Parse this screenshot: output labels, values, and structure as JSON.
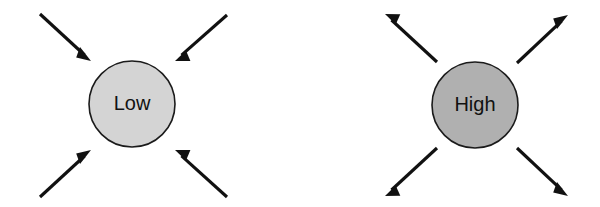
{
  "canvas": {
    "width": 600,
    "height": 207,
    "background": "#ffffff"
  },
  "diagram": {
    "type": "concept-diagram",
    "panels": [
      {
        "id": "panel-low",
        "node": {
          "label": "Low",
          "shape": "circle",
          "center_x": 132,
          "center_y": 104,
          "radius": 43,
          "fill": "#d4d4d4",
          "stroke": "#1b1b1b",
          "text_color": "#111111",
          "font_size": 20
        },
        "arrow_direction": "inward",
        "arrow_count": 4,
        "arrows": [
          {
            "id": "low-arrow-top-left",
            "from_x": 40,
            "from_y": 14,
            "to_x": 91,
            "to_y": 61
          },
          {
            "id": "low-arrow-top-right",
            "from_x": 227,
            "from_y": 15,
            "to_x": 175,
            "to_y": 61
          },
          {
            "id": "low-arrow-bottom-left",
            "from_x": 40,
            "from_y": 197,
            "to_x": 91,
            "to_y": 150
          },
          {
            "id": "low-arrow-bottom-right",
            "from_x": 227,
            "from_y": 197,
            "to_x": 175,
            "to_y": 150
          }
        ]
      },
      {
        "id": "panel-high",
        "node": {
          "label": "High",
          "shape": "circle",
          "center_x": 475,
          "center_y": 105,
          "radius": 43,
          "fill": "#b0b0b0",
          "stroke": "#1b1b1b",
          "text_color": "#111111",
          "font_size": 20
        },
        "arrow_direction": "outward",
        "arrow_count": 4,
        "arrows": [
          {
            "id": "high-arrow-top-left",
            "from_x": 437,
            "from_y": 62,
            "to_x": 385,
            "to_y": 14
          },
          {
            "id": "high-arrow-top-right",
            "from_x": 517,
            "from_y": 63,
            "to_x": 568,
            "to_y": 15
          },
          {
            "id": "high-arrow-bottom-left",
            "from_x": 437,
            "from_y": 148,
            "to_x": 385,
            "to_y": 196
          },
          {
            "id": "high-arrow-bottom-right",
            "from_x": 517,
            "from_y": 148,
            "to_x": 568,
            "to_y": 196
          }
        ]
      }
    ],
    "style": {
      "arrow_color": "#111111",
      "arrow_stroke_width": 3.1,
      "arrow_head_length": 15,
      "arrow_head_width": 11
    }
  }
}
